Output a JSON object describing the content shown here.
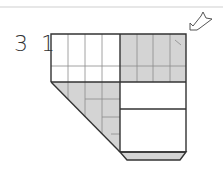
{
  "diagram": {
    "step_number": "3 1",
    "colors": {
      "paper_front": "#ffffff",
      "paper_back": "#d4d4d4",
      "line": "#333333",
      "grid": "#8a8a8a",
      "rule": "#c8c8c8"
    },
    "symbols": [
      "push-arrow"
    ]
  }
}
